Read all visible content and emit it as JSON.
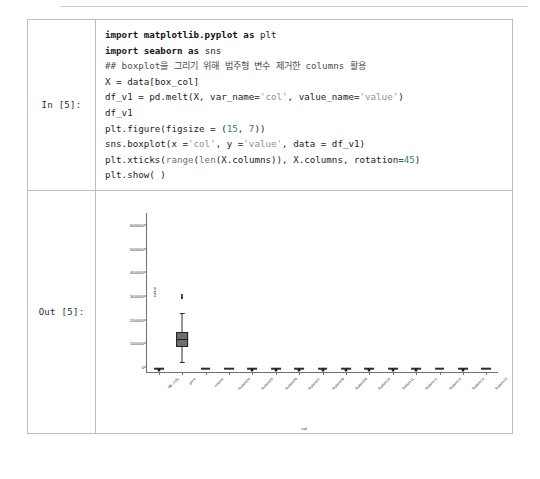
{
  "notebook": {
    "input_prompt": "In [5]:",
    "output_prompt": "Out [5]:",
    "code_lines": [
      "import matplotlib.pyplot as plt",
      "import seaborn as sns",
      "## boxplot을 그리기 위해 범주형 변수 제거한 columns 활용",
      "X = data[box_col]",
      "df_v1 = pd.melt(X, var_name='col', value_name='value')",
      "df_v1",
      "plt.figure(figsize = (15, 7))",
      "sns.boxplot(x ='col', y ='value', data = df_v1)",
      "plt.xticks(range(len(X.columns)), X.columns, rotation=45)",
      "plt.show( )"
    ]
  },
  "chart_data": {
    "type": "box",
    "title": "",
    "xlabel": "col",
    "ylabel": "value",
    "ylim": [
      -20000,
      650000
    ],
    "yticks": [
      0,
      100000,
      200000,
      300000,
      400000,
      500000,
      600000
    ],
    "ytick_labels": [
      "0",
      "100000",
      "200000",
      "300000",
      "400000",
      "500000",
      "600000"
    ],
    "grid": false,
    "legend": null,
    "xtick_rotation": 45,
    "categories": [
      "Mjr_crds",
      "price",
      "volume",
      "feature04",
      "feature05",
      "feature06",
      "feature07",
      "feature08",
      "feature09",
      "feature10",
      "feature11",
      "feature12",
      "feature13",
      "feature14",
      "feature15"
    ],
    "boxes": [
      {
        "category": "Mjr_crds",
        "q1": 0,
        "median": 0,
        "q3": 0,
        "whisker_low": 0,
        "whisker_high": 0,
        "outliers": [
          0
        ]
      },
      {
        "category": "price",
        "q1": 95000,
        "median": 120000,
        "q3": 150000,
        "whisker_low": 20000,
        "whisker_high": 230000,
        "outliers": [
          300000,
          305000,
          312000
        ]
      },
      {
        "category": "volume",
        "q1": 0,
        "median": 0,
        "q3": 0,
        "whisker_low": 0,
        "whisker_high": 0,
        "outliers": []
      },
      {
        "category": "feature04",
        "q1": 0,
        "median": 0,
        "q3": 0,
        "whisker_low": 0,
        "whisker_high": 0,
        "outliers": []
      },
      {
        "category": "feature05",
        "q1": 0,
        "median": 0,
        "q3": 0,
        "whisker_low": 0,
        "whisker_high": 0,
        "outliers": [
          0
        ]
      },
      {
        "category": "feature06",
        "q1": 0,
        "median": 0,
        "q3": 0,
        "whisker_low": 0,
        "whisker_high": 0,
        "outliers": [
          0
        ]
      },
      {
        "category": "feature07",
        "q1": 0,
        "median": 0,
        "q3": 0,
        "whisker_low": 0,
        "whisker_high": 0,
        "outliers": [
          0
        ]
      },
      {
        "category": "feature08",
        "q1": 0,
        "median": 0,
        "q3": 0,
        "whisker_low": 0,
        "whisker_high": 0,
        "outliers": [
          0
        ]
      },
      {
        "category": "feature09",
        "q1": 0,
        "median": 0,
        "q3": 0,
        "whisker_low": 0,
        "whisker_high": 0,
        "outliers": [
          0
        ]
      },
      {
        "category": "feature10",
        "q1": 0,
        "median": 0,
        "q3": 0,
        "whisker_low": 0,
        "whisker_high": 0,
        "outliers": [
          0
        ]
      },
      {
        "category": "feature11",
        "q1": 0,
        "median": 0,
        "q3": 0,
        "whisker_low": 0,
        "whisker_high": 0,
        "outliers": [
          0
        ]
      },
      {
        "category": "feature12",
        "q1": 0,
        "median": 0,
        "q3": 0,
        "whisker_low": 0,
        "whisker_high": 0,
        "outliers": [
          0
        ]
      },
      {
        "category": "feature13",
        "q1": 0,
        "median": 0,
        "q3": 0,
        "whisker_low": 0,
        "whisker_high": 0,
        "outliers": []
      },
      {
        "category": "feature14",
        "q1": 0,
        "median": 0,
        "q3": 0,
        "whisker_low": 0,
        "whisker_high": 0,
        "outliers": [
          0
        ]
      },
      {
        "category": "feature15",
        "q1": 0,
        "median": 0,
        "q3": 0,
        "whisker_low": 0,
        "whisker_high": 0,
        "outliers": []
      }
    ]
  }
}
